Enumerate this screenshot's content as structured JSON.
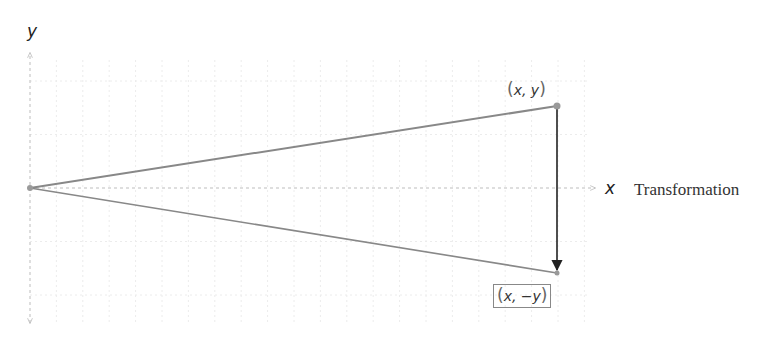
{
  "diagram": {
    "type": "reflection-across-x-axis",
    "caption": "Transformation",
    "axes": {
      "x_label": "x",
      "y_label": "y",
      "x_axis_arrow": "right",
      "y_axis_arrows": [
        "up",
        "down"
      ],
      "grid": true
    },
    "points": [
      {
        "id": "original",
        "label_open": "(",
        "label_body": "x, y",
        "label_close": ")",
        "boxed": false
      },
      {
        "id": "reflected",
        "label_open": "(",
        "label_body": "x, −y",
        "label_close": ")",
        "boxed": true
      }
    ],
    "origin_label": "",
    "arrow": {
      "from": "original",
      "to": "reflected",
      "direction": "down"
    },
    "colors": {
      "segment": "#888888",
      "arrow": "#222222",
      "grid": "#e6e6e6",
      "axis": "#bdbdbd",
      "point": "#999999"
    }
  }
}
